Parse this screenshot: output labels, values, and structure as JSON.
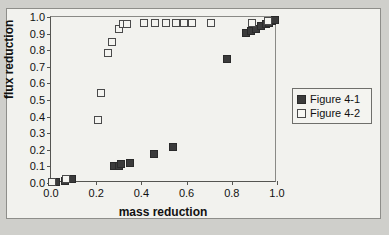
{
  "chart_data": {
    "type": "scatter",
    "title": "",
    "xlabel": "mass reduction",
    "ylabel": "flux reduction",
    "xlim": [
      0.0,
      1.0
    ],
    "ylim": [
      0.0,
      1.0
    ],
    "grid": false,
    "legend_position": "right",
    "xticks": [
      "0.0",
      "0.2",
      "0.4",
      "0.6",
      "0.8",
      "1.0"
    ],
    "xtick_values": [
      0.0,
      0.2,
      0.4,
      0.6,
      0.8,
      1.0
    ],
    "yticks": [
      "0.0",
      "0.1",
      "0.2",
      "0.3",
      "0.4",
      "0.5",
      "0.6",
      "0.7",
      "0.8",
      "0.9",
      "1.0"
    ],
    "ytick_values": [
      0.0,
      0.1,
      0.2,
      0.3,
      0.4,
      0.5,
      0.6,
      0.7,
      0.8,
      0.9,
      1.0
    ],
    "series": [
      {
        "name": "Figure 4-1",
        "marker": "filled-square",
        "color": "#3b3b3b",
        "points": [
          [
            0.005,
            0.005
          ],
          [
            0.02,
            0.005
          ],
          [
            0.06,
            0.01
          ],
          [
            0.085,
            0.022
          ],
          [
            0.095,
            0.025
          ],
          [
            0.28,
            0.1
          ],
          [
            0.3,
            0.105
          ],
          [
            0.31,
            0.112
          ],
          [
            0.35,
            0.122
          ],
          [
            0.455,
            0.175
          ],
          [
            0.54,
            0.218
          ],
          [
            0.78,
            0.745
          ],
          [
            0.865,
            0.905
          ],
          [
            0.885,
            0.915
          ],
          [
            0.905,
            0.93
          ],
          [
            0.93,
            0.945
          ],
          [
            0.95,
            0.955
          ],
          [
            0.965,
            0.965
          ],
          [
            0.98,
            0.975
          ],
          [
            0.99,
            0.985
          ]
        ]
      },
      {
        "name": "Figure 4-2",
        "marker": "open-square",
        "color": "#4a4a4a",
        "points": [
          [
            0.005,
            0.005
          ],
          [
            0.065,
            0.022
          ],
          [
            0.21,
            0.38
          ],
          [
            0.222,
            0.545
          ],
          [
            0.25,
            0.785
          ],
          [
            0.272,
            0.85
          ],
          [
            0.3,
            0.93
          ],
          [
            0.32,
            0.955
          ],
          [
            0.335,
            0.96
          ],
          [
            0.41,
            0.962
          ],
          [
            0.46,
            0.962
          ],
          [
            0.51,
            0.962
          ],
          [
            0.555,
            0.962
          ],
          [
            0.59,
            0.962
          ],
          [
            0.625,
            0.962
          ],
          [
            0.71,
            0.962
          ],
          [
            0.89,
            0.965
          ],
          [
            0.96,
            0.975
          ]
        ]
      }
    ]
  },
  "legend": {
    "items": [
      {
        "label": "Figure 4-1",
        "marker": "filled-square"
      },
      {
        "label": "Figure 4-2",
        "marker": "open-square"
      }
    ]
  }
}
